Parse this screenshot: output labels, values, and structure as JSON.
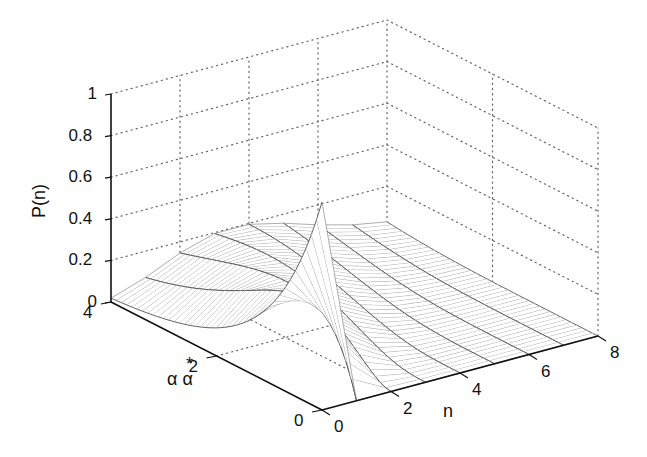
{
  "chart_data": {
    "type": "surface3d",
    "title": "",
    "function": "Poisson distribution P(n) = exp(-x) * x^n / Gamma(n+1), x = alpha*alpha^*",
    "xlabel": "n",
    "ylabel": "αα*",
    "ylabel_parts": {
      "star": "*",
      "base": "α α"
    },
    "zlabel": "P(n)",
    "xlim": [
      0,
      8
    ],
    "ylim": [
      0,
      4
    ],
    "zlim": [
      0,
      1
    ],
    "x_ticks": [
      "0",
      "2",
      "4",
      "6",
      "8"
    ],
    "y_ticks": [
      "0",
      "2",
      "4"
    ],
    "z_ticks": [
      "0",
      "0.2",
      "0.4",
      "0.6",
      "0.8",
      "1"
    ],
    "grid": true,
    "grid_style": "dotted",
    "mesh_color": "#555555",
    "peak": {
      "n": 0,
      "alpha_alpha_star": 0,
      "P": 1.0
    },
    "sample_values": [
      {
        "x": 0,
        "n": 0,
        "P": 1.0
      },
      {
        "x": 1,
        "n": 1,
        "P": 0.368
      },
      {
        "x": 2,
        "n": 2,
        "P": 0.271
      },
      {
        "x": 3,
        "n": 3,
        "P": 0.224
      },
      {
        "x": 4,
        "n": 4,
        "P": 0.195
      },
      {
        "x": 4,
        "n": 0,
        "P": 0.018
      },
      {
        "x": 4,
        "n": 8,
        "P": 0.03
      }
    ],
    "mesh": {
      "n_lines": 9,
      "x_lines": 41
    }
  }
}
